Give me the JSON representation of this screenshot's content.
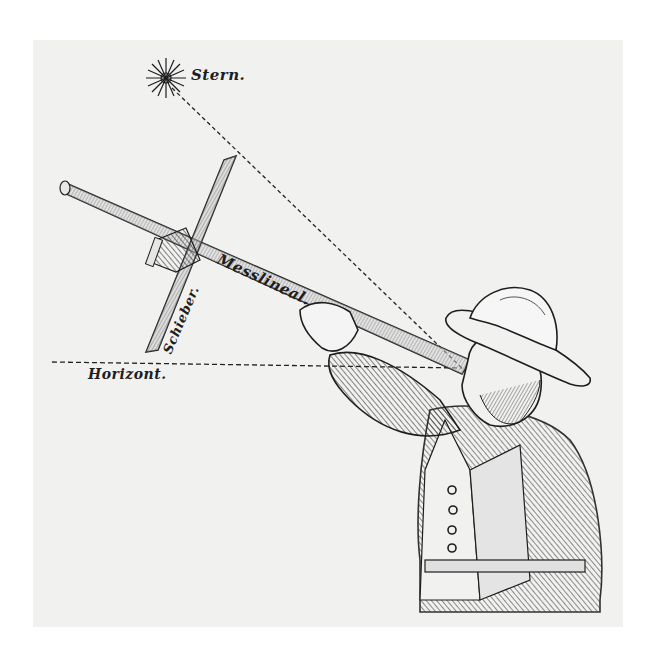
{
  "illustration": {
    "subject": "Man sighting a star with a cross-staff (Jakobsstab)",
    "labels": {
      "star": "Stern.",
      "rod": "Messlineal.",
      "slider": "Schieber.",
      "horizon": "Horizont."
    }
  },
  "colors": {
    "paper": "#f1f1f0",
    "ink": "#1e1e1e",
    "shade": "#8a8a8a"
  }
}
